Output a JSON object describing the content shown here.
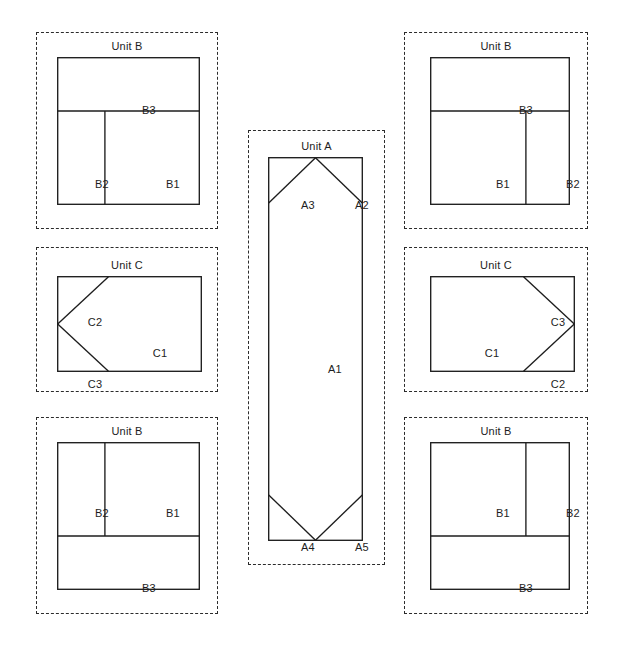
{
  "canvas": {
    "width": 621,
    "height": 649,
    "background": "#ffffff"
  },
  "style": {
    "line_color": "#1d1d1d",
    "dash_color": "#2b2b2b",
    "label_color": "#1d1d1d"
  },
  "panels": [
    {
      "id": "unit-b-top-left",
      "title": "Unit B",
      "unit": "B",
      "variant": "b-top-left",
      "frame": {
        "x": 36,
        "y": 32,
        "w": 182,
        "h": 197
      },
      "box": {
        "x": 21,
        "y": 25,
        "w": 143,
        "h": 148
      },
      "cells": [
        {
          "name": "B3",
          "label": "B3",
          "cx": 92,
          "cy": 53
        },
        {
          "name": "B2",
          "label": "B2",
          "cx": 45,
          "cy": 127
        },
        {
          "name": "B1",
          "label": "B1",
          "cx": 116,
          "cy": 127
        }
      ]
    },
    {
      "id": "unit-b-top-right",
      "title": "Unit B",
      "unit": "B",
      "variant": "b-top-right",
      "frame": {
        "x": 404,
        "y": 32,
        "w": 184,
        "h": 197
      },
      "box": {
        "x": 26,
        "y": 25,
        "w": 140,
        "h": 148
      },
      "cells": [
        {
          "name": "B3",
          "label": "B3",
          "cx": 96,
          "cy": 53
        },
        {
          "name": "B1",
          "label": "B1",
          "cx": 73,
          "cy": 127
        },
        {
          "name": "B2",
          "label": "B2",
          "cx": 143,
          "cy": 127
        }
      ]
    },
    {
      "id": "unit-c-left",
      "title": "Unit C",
      "unit": "C",
      "variant": "c-left",
      "frame": {
        "x": 36,
        "y": 247,
        "w": 182,
        "h": 145
      },
      "box": {
        "x": 21,
        "y": 29,
        "w": 145,
        "h": 96
      },
      "cells": [
        {
          "name": "C2",
          "label": "C2",
          "cx": 38,
          "cy": 46
        },
        {
          "name": "C1",
          "label": "C1",
          "cx": 103,
          "cy": 77
        },
        {
          "name": "C3",
          "label": "C3",
          "cx": 38,
          "cy": 108
        }
      ]
    },
    {
      "id": "unit-c-right",
      "title": "Unit C",
      "unit": "C",
      "variant": "c-right",
      "frame": {
        "x": 404,
        "y": 247,
        "w": 184,
        "h": 145
      },
      "box": {
        "x": 26,
        "y": 29,
        "w": 145,
        "h": 96
      },
      "cells": [
        {
          "name": "C3",
          "label": "C3",
          "cx": 128,
          "cy": 46
        },
        {
          "name": "C1",
          "label": "C1",
          "cx": 62,
          "cy": 77
        },
        {
          "name": "C2",
          "label": "C2",
          "cx": 128,
          "cy": 108
        }
      ]
    },
    {
      "id": "unit-b-bottom-left",
      "title": "Unit B",
      "unit": "B",
      "variant": "b-bottom-left",
      "frame": {
        "x": 36,
        "y": 417,
        "w": 182,
        "h": 197
      },
      "box": {
        "x": 21,
        "y": 25,
        "w": 143,
        "h": 148
      },
      "cells": [
        {
          "name": "B2",
          "label": "B2",
          "cx": 45,
          "cy": 71
        },
        {
          "name": "B1",
          "label": "B1",
          "cx": 116,
          "cy": 71
        },
        {
          "name": "B3",
          "label": "B3",
          "cx": 92,
          "cy": 146
        }
      ]
    },
    {
      "id": "unit-b-bottom-right",
      "title": "Unit B",
      "unit": "B",
      "variant": "b-bottom-right",
      "frame": {
        "x": 404,
        "y": 417,
        "w": 184,
        "h": 197
      },
      "box": {
        "x": 26,
        "y": 25,
        "w": 140,
        "h": 148
      },
      "cells": [
        {
          "name": "B1",
          "label": "B1",
          "cx": 73,
          "cy": 71
        },
        {
          "name": "B2",
          "label": "B2",
          "cx": 143,
          "cy": 71
        },
        {
          "name": "B3",
          "label": "B3",
          "cx": 96,
          "cy": 146
        }
      ]
    },
    {
      "id": "unit-a-center",
      "title": "Unit A",
      "unit": "A",
      "variant": "a-center",
      "frame": {
        "x": 248,
        "y": 130,
        "w": 137,
        "h": 435
      },
      "box": {
        "x": 20,
        "y": 27,
        "w": 95,
        "h": 384
      },
      "cells": [
        {
          "name": "A3",
          "label": "A3",
          "cx": 40,
          "cy": 48
        },
        {
          "name": "A2",
          "label": "A2",
          "cx": 94,
          "cy": 48
        },
        {
          "name": "A1",
          "label": "A1",
          "cx": 67,
          "cy": 212
        },
        {
          "name": "A4",
          "label": "A4",
          "cx": 40,
          "cy": 390
        },
        {
          "name": "A5",
          "label": "A5",
          "cx": 94,
          "cy": 390
        }
      ]
    }
  ]
}
